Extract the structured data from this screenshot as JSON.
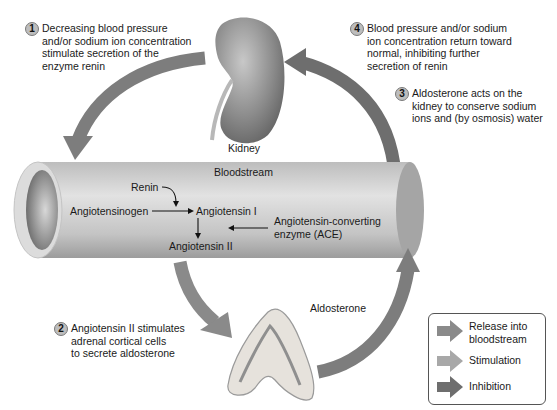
{
  "diagram": {
    "organs": {
      "kidney_label": "Kidney",
      "bloodstream_label": "Bloodstream",
      "aldosterone_label": "Aldosterone"
    },
    "steps": [
      {
        "number": "1",
        "text": "Decreasing blood pressure\nand/or sodium ion concentration\nstimulate secretion of the\nenzyme renin"
      },
      {
        "number": "2",
        "text": "Angiotensin II stimulates\nadrenal cortical cells\nto secrete aldosterone"
      },
      {
        "number": "3",
        "text": "Aldosterone acts on the\nkidney to conserve sodium\nions and (by osmosis) water"
      },
      {
        "number": "4",
        "text": "Blood pressure and/or sodium\nion concentration return toward\nnormal, inhibiting further\nsecretion of renin"
      }
    ],
    "bloodstream_reactions": {
      "renin": "Renin",
      "angiotensinogen": "Angiotensinogen",
      "angiotensin_i": "Angiotensin I",
      "angiotensin_ii": "Angiotensin II",
      "ace": "Angiotensin-converting\nenzyme (ACE)"
    },
    "legend": {
      "items": [
        {
          "label": "Release into\nbloodstream",
          "color": "#8a8a8a"
        },
        {
          "label": "Stimulation",
          "color": "#a8a8a8"
        },
        {
          "label": "Inhibition",
          "color": "#6e6e6e"
        }
      ]
    },
    "colors": {
      "arrow": "#7d7d7d",
      "tube_light": "#e4e4e4",
      "tube_dark": "#9a9a9a"
    }
  }
}
